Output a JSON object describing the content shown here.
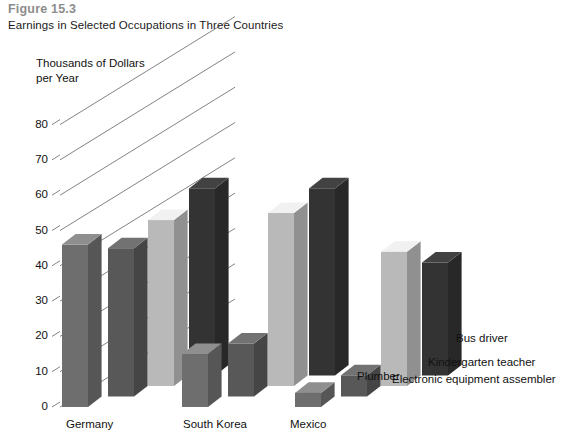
{
  "figure": {
    "number": "Figure 15.3",
    "caption": "Earnings in Selected Occupations in Three Countries"
  },
  "chart_data": {
    "type": "bar",
    "title": "Earnings in Selected Occupations in Three Countries",
    "subtitle": "Figure 15.3",
    "ylabel": "Thousands of Dollars\nper Year",
    "xlabel": "",
    "ylim": [
      0,
      80
    ],
    "yticks": [
      0,
      10,
      20,
      30,
      40,
      50,
      60,
      70,
      80
    ],
    "ytick_labels": [
      "0",
      "10",
      "20",
      "30",
      "40",
      "50",
      "60",
      "70",
      "80"
    ],
    "grid": true,
    "grid_style": "diagonal-3d-receding",
    "projection": "3d-bars",
    "legend_position": "right-inline-diagonal",
    "categories": [
      "Germany",
      "South Korea",
      "Mexico"
    ],
    "series": [
      {
        "name": "Plumber",
        "color": "#6e6e6e",
        "values": [
          46,
          15,
          4
        ]
      },
      {
        "name": "Electronic equipment assembler",
        "color": "#585858",
        "values": [
          42,
          15,
          6
        ]
      },
      {
        "name": "Kindergarten teacher",
        "color": "#b9b9b9",
        "values": [
          47,
          49,
          38
        ]
      },
      {
        "name": "Bus driver",
        "color": "#333333",
        "values": [
          53,
          53,
          32
        ]
      }
    ]
  },
  "colors": {
    "figure_number": "#8c8c8c",
    "text": "#111111",
    "gridline": "#4d4d4d",
    "background": "#ffffff"
  }
}
